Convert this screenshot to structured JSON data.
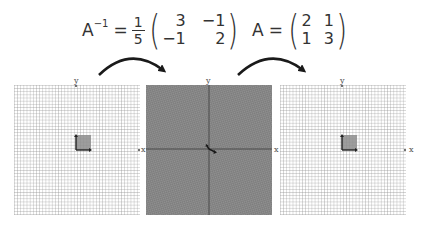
{
  "formulas": {
    "inverse": {
      "lhs": "A",
      "lhs_superscript": "−1",
      "equals": "=",
      "scalar_numerator": "1",
      "scalar_denominator": "5",
      "matrix": [
        [
          "3",
          "−1"
        ],
        [
          "−1",
          "2"
        ]
      ]
    },
    "forward": {
      "lhs": "A",
      "equals": "=",
      "matrix": [
        [
          "2",
          "1"
        ],
        [
          "1",
          "3"
        ]
      ]
    }
  },
  "panels": [
    {
      "id": "left",
      "x_label": "x",
      "y_label": "y",
      "background": "#ffffff",
      "grid_color": "#9a9a9a",
      "unit_square_color": "#8c8c8c"
    },
    {
      "id": "middle",
      "x_label": "x",
      "y_label": "y",
      "background": "#8a8a8a",
      "grid_color": "#6e6e6e",
      "unit_square_color": "#333333"
    },
    {
      "id": "right",
      "x_label": "x",
      "y_label": "y",
      "background": "#ffffff",
      "grid_color": "#9a9a9a",
      "unit_square_color": "#8c8c8c"
    }
  ],
  "arrows": [
    {
      "id": "apply-inverse",
      "from": "left",
      "to": "middle"
    },
    {
      "id": "apply-forward",
      "from": "middle",
      "to": "right"
    }
  ]
}
